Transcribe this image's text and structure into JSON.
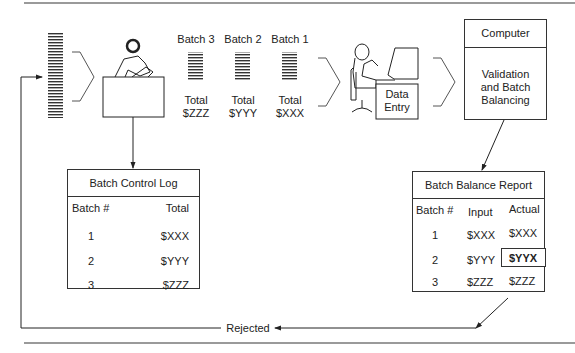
{
  "batches": [
    {
      "label": "Batch 3",
      "total_label": "Total",
      "total": "$ZZZ"
    },
    {
      "label": "Batch 2",
      "total_label": "Total",
      "total": "$YYY"
    },
    {
      "label": "Batch 1",
      "total_label": "Total",
      "total": "$XXX"
    }
  ],
  "data_entry": {
    "line1": "Data",
    "line2": "Entry"
  },
  "computer": {
    "title": "Computer",
    "line1": "Validation",
    "line2": "and Batch",
    "line3": "Balancing"
  },
  "control_log": {
    "title": "Batch Control Log",
    "headers": [
      "Batch #",
      "Total"
    ],
    "rows": [
      {
        "batch": "1",
        "total": "$XXX"
      },
      {
        "batch": "2",
        "total": "$YYY"
      },
      {
        "batch": "3",
        "total": "$ZZZ"
      }
    ]
  },
  "balance_report": {
    "title": "Batch Balance Report",
    "headers": [
      "Batch #",
      "Input",
      "Actual"
    ],
    "rows": [
      {
        "batch": "1",
        "input": "$XXX",
        "actual": "$XXX"
      },
      {
        "batch": "2",
        "input": "$YYY",
        "actual": "$YYX"
      },
      {
        "batch": "3",
        "input": "$ZZZ",
        "actual": "$ZZZ"
      }
    ]
  },
  "rejected_label": "Rejected"
}
